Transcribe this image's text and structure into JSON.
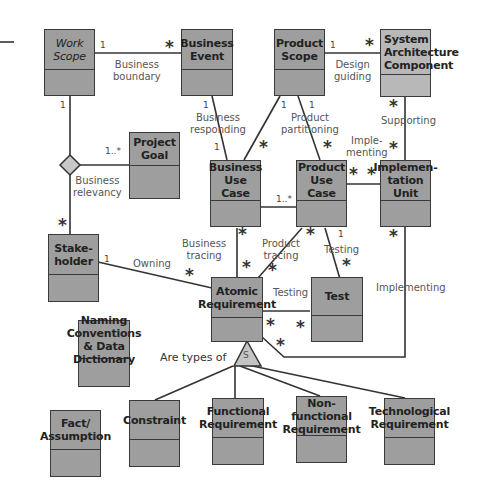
{
  "diagram": {
    "type": "uml-class-diagram",
    "classes": [
      {
        "id": "work-scope",
        "name": "Work\nScope"
      },
      {
        "id": "business-event",
        "name": "Business\nEvent"
      },
      {
        "id": "product-scope",
        "name": "Product\nScope"
      },
      {
        "id": "system-architecture-component",
        "name": "System\nArchitecture\nComponent"
      },
      {
        "id": "project-goal",
        "name": "Project\nGoal"
      },
      {
        "id": "business-use-case",
        "name": "Business\nUse Case"
      },
      {
        "id": "product-use-case",
        "name": "Product\nUse Case"
      },
      {
        "id": "implementation-unit",
        "name": "Implemen-\ntation Unit"
      },
      {
        "id": "stakeholder",
        "name": "Stake-\nholder"
      },
      {
        "id": "atomic-requirement",
        "name": "Atomic\nRequirement"
      },
      {
        "id": "test",
        "name": "Test"
      },
      {
        "id": "naming-conventions",
        "name": "Naming\nConventions & Data\nDictionary"
      },
      {
        "id": "fact-assumption",
        "name": "Fact/\nAssumption"
      },
      {
        "id": "constraint",
        "name": "Constraint"
      },
      {
        "id": "functional-requirement",
        "name": "Functional\nRequirement"
      },
      {
        "id": "non-functional-requirement",
        "name": "Non-functional\nRequirement"
      },
      {
        "id": "technological-requirement",
        "name": "Technological\nRequirement"
      }
    ],
    "associations": [
      {
        "label": "Business\nboundary",
        "from": "Work Scope",
        "to": "Business Event",
        "from_mult": "1",
        "to_mult": "*"
      },
      {
        "label": "Design\nguiding",
        "from": "Product Scope",
        "to": "System Architecture Component",
        "from_mult": "1",
        "to_mult": "*"
      },
      {
        "label": "Business\nresponding",
        "from": "Business Event",
        "to": "Business Use Case",
        "from_mult": "1",
        "to_mult": "1"
      },
      {
        "label": "Product\npartitioning",
        "from": "Product Scope",
        "to": "Product Use Case",
        "from_mult": "1",
        "to_mult": "*"
      },
      {
        "label": "",
        "from": "Product Scope",
        "to": "Business Use Case",
        "from_mult": "1",
        "to_mult": "*"
      },
      {
        "label": "Supporting",
        "from": "System Architecture Component",
        "to": "Implementation Unit",
        "from_mult": "*",
        "to_mult": "*"
      },
      {
        "label": "Imple-\nmenting",
        "from": "Product Use Case",
        "to": "Implementation Unit",
        "from_mult": "*",
        "to_mult": "*"
      },
      {
        "label": "Business\nrelevancy",
        "from": "Work Scope",
        "to": "Stakeholder",
        "from_mult": "1",
        "to_mult": "*",
        "extra": "Project Goal 1..*"
      },
      {
        "label": "",
        "from": "Business Use Case",
        "to": "Product Use Case",
        "from_mult": "",
        "to_mult": "1..*"
      },
      {
        "label": "Business\ntracing",
        "from": "Business Use Case",
        "to": "Atomic Requirement",
        "from_mult": "*",
        "to_mult": "*"
      },
      {
        "label": "Product\ntracing",
        "from": "Product Use Case",
        "to": "Atomic Requirement",
        "from_mult": "*",
        "to_mult": "*"
      },
      {
        "label": "Testing",
        "from": "Product Use Case",
        "to": "Test",
        "from_mult": "1",
        "to_mult": "*"
      },
      {
        "label": "Owning",
        "from": "Stakeholder",
        "to": "Atomic Requirement",
        "from_mult": "1",
        "to_mult": "*"
      },
      {
        "label": "Testing",
        "from": "Atomic Requirement",
        "to": "Test",
        "from_mult": "*",
        "to_mult": "*"
      },
      {
        "label": "Implementing",
        "from": "Implementation Unit",
        "to": "Atomic Requirement",
        "from_mult": "*",
        "to_mult": "*"
      }
    ],
    "generalization": {
      "label": "Are types of",
      "symbol": "S"
    }
  },
  "labels": {
    "business_boundary": "Business\nboundary",
    "design_guiding": "Design\nguiding",
    "business_responding": "Business\nresponding",
    "product_partitioning": "Product\npartitioning",
    "supporting": "Supporting",
    "implementing_short": "Imple-\nmenting",
    "business_relevancy": "Business\nrelevancy",
    "business_tracing": "Business\ntracing",
    "product_tracing": "Product\ntracing",
    "testing_1": "Testing",
    "testing_2": "Testing",
    "owning": "Owning",
    "implementing": "Implementing",
    "are_types_of": "Are types of",
    "s_symbol": "S"
  },
  "mult": {
    "one": "1",
    "one_many": "1..*",
    "many": "*"
  }
}
